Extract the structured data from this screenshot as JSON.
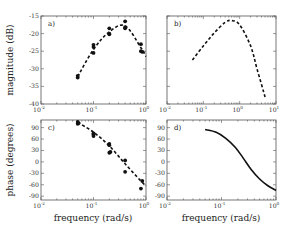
{
  "figure": {
    "ylabel_top": "magnitude (dB)",
    "ylabel_bottom": "phase (degrees)",
    "xlabel": "frequency (rad/s)"
  },
  "chart_data": [
    {
      "panel": "a)",
      "type": "scatter",
      "title": "",
      "xlabel": "",
      "ylabel": "magnitude (dB)",
      "xscale": "log",
      "xlim": [
        0.01,
        1
      ],
      "ylim": [
        -40,
        -15
      ],
      "xticks": [
        "10^-2",
        "10^-1",
        "10^0"
      ],
      "yticks": [
        -15,
        -20,
        -25,
        -30,
        -35,
        -40
      ],
      "grid": false,
      "series": [
        {
          "name": "measured",
          "style": "markers",
          "points": [
            [
              0.05,
              -32.0
            ],
            [
              0.05,
              -32.5
            ],
            [
              0.1,
              -23.2
            ],
            [
              0.1,
              -25.5
            ],
            [
              0.1,
              -23.8
            ],
            [
              0.2,
              -18.5
            ],
            [
              0.2,
              -20.2
            ],
            [
              0.2,
              -20.0
            ],
            [
              0.4,
              -16.5
            ],
            [
              0.4,
              -18.5
            ],
            [
              0.4,
              -18.2
            ],
            [
              0.8,
              -23.0
            ],
            [
              0.8,
              -25.0
            ],
            [
              0.85,
              -25.2
            ]
          ]
        },
        {
          "name": "fit",
          "style": "dashed",
          "points": [
            [
              0.05,
              -32.2
            ],
            [
              0.1,
              -24.5
            ],
            [
              0.2,
              -19.5
            ],
            [
              0.4,
              -17.8
            ],
            [
              0.8,
              -24.0
            ],
            [
              1.0,
              -26.5
            ]
          ]
        }
      ]
    },
    {
      "panel": "b)",
      "type": "line",
      "xscale": "log",
      "xlim": [
        0.01,
        10
      ],
      "ylim": [
        -40,
        -15
      ],
      "xticks": [
        "10^-2",
        "10^-1",
        "10^0",
        "10^1"
      ],
      "grid": false,
      "series": [
        {
          "name": "model",
          "style": "dashed",
          "points": [
            [
              0.05,
              -27.5
            ],
            [
              0.1,
              -23.5
            ],
            [
              0.2,
              -19.8
            ],
            [
              0.4,
              -16.8
            ],
            [
              0.6,
              -16.3
            ],
            [
              1.0,
              -17.5
            ],
            [
              2.0,
              -23.5
            ],
            [
              3.0,
              -30.0
            ],
            [
              5.0,
              -38.0
            ]
          ]
        }
      ]
    },
    {
      "panel": "c)",
      "type": "scatter",
      "xlabel": "frequency (rad/s)",
      "ylabel": "phase (degrees)",
      "xscale": "log",
      "xlim": [
        0.01,
        1
      ],
      "ylim": [
        -100,
        110
      ],
      "xticks": [
        "10^-2",
        "10^-1",
        "10^0"
      ],
      "yticks": [
        90,
        60,
        30,
        0,
        -30,
        -60,
        -90
      ],
      "grid": false,
      "series": [
        {
          "name": "measured",
          "style": "markers",
          "points": [
            [
              0.05,
              105
            ],
            [
              0.05,
              100
            ],
            [
              0.052,
              102
            ],
            [
              0.1,
              75
            ],
            [
              0.1,
              68
            ],
            [
              0.1,
              72
            ],
            [
              0.2,
              47
            ],
            [
              0.2,
              44
            ],
            [
              0.2,
              24
            ],
            [
              0.21,
              26
            ],
            [
              0.4,
              4
            ],
            [
              0.4,
              -26
            ],
            [
              0.8,
              -70
            ],
            [
              0.85,
              -50
            ]
          ]
        },
        {
          "name": "fit",
          "style": "dashed",
          "points": [
            [
              0.05,
              104
            ],
            [
              0.1,
              78
            ],
            [
              0.2,
              42
            ],
            [
              0.4,
              -5
            ],
            [
              0.8,
              -50
            ],
            [
              1.0,
              -63
            ]
          ]
        }
      ]
    },
    {
      "panel": "d)",
      "type": "line",
      "xlabel": "frequency (rad/s)",
      "xscale": "log",
      "xlim": [
        0.01,
        1
      ],
      "ylim": [
        -100,
        110
      ],
      "xticks": [
        "10^-2",
        "10^-1",
        "10^0"
      ],
      "yticks": [
        90,
        60,
        30,
        0,
        -30,
        -60,
        -90
      ],
      "grid": false,
      "series": [
        {
          "name": "model",
          "style": "solid",
          "points": [
            [
              0.05,
              85
            ],
            [
              0.08,
              78
            ],
            [
              0.12,
              62
            ],
            [
              0.18,
              38
            ],
            [
              0.25,
              10
            ],
            [
              0.35,
              -20
            ],
            [
              0.5,
              -45
            ],
            [
              0.7,
              -62
            ],
            [
              1.0,
              -75
            ]
          ]
        }
      ]
    }
  ]
}
